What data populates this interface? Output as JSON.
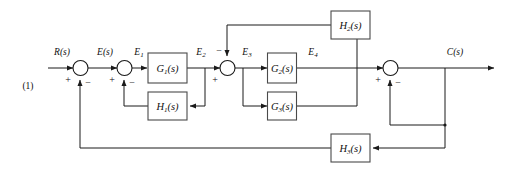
{
  "figure": {
    "number": "(1)",
    "type": "control-system-block-diagram"
  },
  "signals": {
    "input": "R(s)",
    "e": "E(s)",
    "e1_base": "E",
    "e1_sub": "1",
    "e2_base": "E",
    "e2_sub": "2",
    "e3_base": "E",
    "e3_sub": "3",
    "e4_base": "E",
    "e4_sub": "4",
    "output": "C(s)"
  },
  "blocks": [
    {
      "id": "G1",
      "base": "G",
      "sub": "1",
      "suffix": "(s)",
      "label": "G1(s)"
    },
    {
      "id": "H1",
      "base": "H",
      "sub": "1",
      "suffix": "(s)",
      "label": "H1(s)"
    },
    {
      "id": "G2",
      "base": "G",
      "sub": "2",
      "suffix": "(s)",
      "label": "G2(s)"
    },
    {
      "id": "G3",
      "base": "G",
      "sub": "3",
      "suffix": "(s)",
      "label": "G3(s)"
    },
    {
      "id": "H2",
      "base": "H",
      "sub": "2",
      "suffix": "(s)",
      "label": "H2(s)"
    },
    {
      "id": "H3",
      "base": "H",
      "sub": "3",
      "suffix": "(s)",
      "label": "H3(s)"
    }
  ],
  "summing_junctions": [
    {
      "id": "sum1",
      "signs": [
        "+",
        "-"
      ],
      "plus": "+",
      "minus": "−"
    },
    {
      "id": "sum2",
      "signs": [
        "+",
        "-"
      ],
      "plus": "+",
      "minus": "−"
    },
    {
      "id": "sum3",
      "signs": [
        "+",
        "-"
      ],
      "plus": "+",
      "minus": "−"
    },
    {
      "id": "sum4",
      "signs": [
        "+",
        "-"
      ],
      "plus": "+",
      "minus": "−"
    }
  ],
  "signs": {
    "plus": "+",
    "minus": "−"
  },
  "colors": {
    "wire": "#1a1a1a",
    "box_border": "#4a4a4a",
    "background": "#ffffff",
    "text": "#111111"
  }
}
